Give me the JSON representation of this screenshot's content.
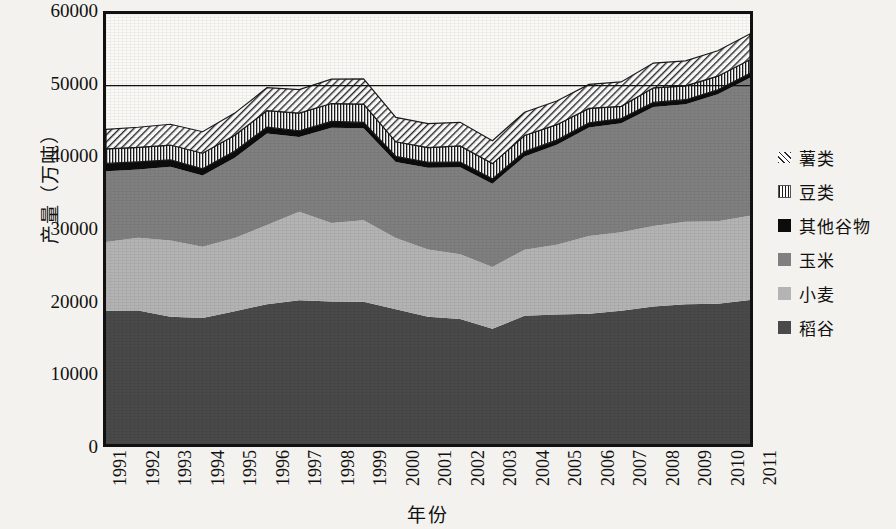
{
  "chart_data": {
    "type": "area",
    "title": "",
    "xlabel": "年份",
    "ylabel": "产量（万吨）",
    "ylim": [
      0,
      60000
    ],
    "yticks": [
      0,
      10000,
      20000,
      30000,
      40000,
      50000,
      60000
    ],
    "grid": "horizontal-50000-only",
    "legend_position": "right",
    "stacked": true,
    "categories": [
      1991,
      1992,
      1993,
      1994,
      1995,
      1996,
      1997,
      1998,
      1999,
      2000,
      2001,
      2002,
      2003,
      2004,
      2005,
      2006,
      2007,
      2008,
      2009,
      2010,
      2011
    ],
    "series": [
      {
        "name": "稻谷",
        "color": "#4a4a4a",
        "pattern": "solid",
        "values": [
          18580,
          18620,
          17770,
          17590,
          18520,
          19510,
          20070,
          19870,
          19850,
          18790,
          17758,
          17454,
          16066,
          17909,
          18059,
          18172,
          18603,
          19190,
          19510,
          19576,
          20100
        ]
      },
      {
        "name": "小麦",
        "color": "#b4b4b4",
        "pattern": "solid",
        "values": [
          9595,
          10159,
          10639,
          9930,
          10221,
          11057,
          12329,
          10973,
          11388,
          9964,
          9387,
          9029,
          8649,
          9195,
          9745,
          10847,
          10930,
          11246,
          11512,
          11518,
          11740
        ]
      },
      {
        "name": "玉米",
        "color": "#808080",
        "pattern": "solid",
        "values": [
          9877,
          9538,
          10270,
          9928,
          11199,
          12747,
          10431,
          13295,
          12809,
          10600,
          11409,
          12131,
          11583,
          13029,
          13937,
          15160,
          15230,
          16591,
          16397,
          17725,
          19278
        ]
      },
      {
        "name": "其他谷物",
        "color": "#0c0c0c",
        "pattern": "solid",
        "values": [
          1100,
          1050,
          980,
          960,
          930,
          900,
          880,
          870,
          830,
          800,
          760,
          730,
          700,
          680,
          660,
          650,
          640,
          630,
          620,
          610,
          600
        ]
      },
      {
        "name": "豆类",
        "color": "#ffffff",
        "pattern": "vertical-hatch",
        "values": [
          2036,
          2030,
          2058,
          2165,
          2200,
          2300,
          2450,
          2500,
          2560,
          2010,
          2053,
          2241,
          2127,
          2232,
          2157,
          2004,
          1720,
          2043,
          1930,
          1897,
          1910
        ]
      },
      {
        "name": "薯类",
        "color": "#ffffff",
        "pattern": "diagonal-hatch",
        "values": [
          2700,
          2800,
          2900,
          3000,
          3100,
          3200,
          3300,
          3400,
          3500,
          3400,
          3350,
          3300,
          3200,
          3250,
          3300,
          3350,
          3400,
          3450,
          3500,
          3550,
          3600
        ]
      }
    ],
    "totals": [
      43888,
      44197,
      44617,
      43572,
      46170,
      49714,
      49460,
      50905,
      50937,
      45564,
      44717,
      44885,
      42325,
      46295,
      47858,
      50183,
      50523,
      53150,
      53469,
      54876,
      57228
    ]
  },
  "axes": {
    "y_label": "产量（万吨）",
    "x_label": "年份",
    "y_ticks": [
      "60000",
      "50000",
      "40000",
      "30000",
      "20000",
      "10000",
      "0"
    ],
    "x_ticks": [
      "1991",
      "1992",
      "1993",
      "1994",
      "1995",
      "1996",
      "1997",
      "1998",
      "1999",
      "2000",
      "2001",
      "2002",
      "2003",
      "2004",
      "2005",
      "2006",
      "2007",
      "2008",
      "2009",
      "2010",
      "2011"
    ]
  },
  "legend": {
    "items": [
      {
        "label": "薯类",
        "swatch": "diagonal-hatch-swatch"
      },
      {
        "label": "豆类",
        "swatch": "vertical-hatch-swatch"
      },
      {
        "label": "其他谷物",
        "swatch": "solid-black-swatch"
      },
      {
        "label": "玉米",
        "swatch": "medium-gray-swatch"
      },
      {
        "label": "小麦",
        "swatch": "light-gray-swatch"
      },
      {
        "label": "稻谷",
        "swatch": "dark-gray-swatch"
      }
    ]
  },
  "colors": {
    "rice": "#4a4a4a",
    "wheat": "#b4b4b4",
    "corn": "#808080",
    "other_grain": "#0c0c0c",
    "axis": "#111111",
    "background": "#f4f2ee"
  }
}
